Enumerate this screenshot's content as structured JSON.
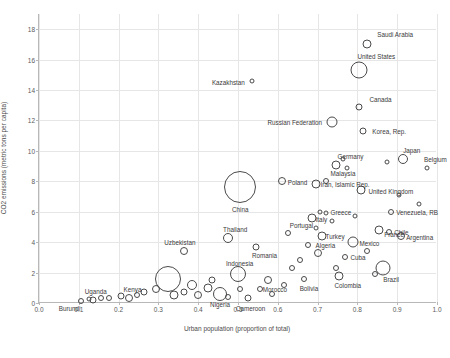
{
  "chart_data": {
    "type": "scatter",
    "title": "",
    "xlabel": "Urban population (proportion of total)",
    "ylabel": "CO2 emissions (metric tons per capita)",
    "xlim": [
      0.0,
      1.0
    ],
    "ylim": [
      0,
      19
    ],
    "xticks": [
      "0.0",
      "0.1",
      "0.2",
      "0.3",
      "0.4",
      "0.5",
      "0.6",
      "0.7",
      "0.8",
      "0.9",
      "1.0"
    ],
    "yticks": [
      "0",
      "2",
      "4",
      "6",
      "8",
      "10",
      "12",
      "14",
      "16",
      "18"
    ],
    "grid": true,
    "legend": "none",
    "bubble_meaning": "marker size proportional to population",
    "points": [
      {
        "label": "Saudi Arabia",
        "x": 0.825,
        "y": 17.0,
        "size": 9,
        "label_dx": 10,
        "label_dy": -10
      },
      {
        "label": "United States",
        "x": 0.805,
        "y": 15.3,
        "size": 17,
        "label_dx": -2,
        "label_dy": -14
      },
      {
        "label": "Kazakhstan",
        "x": 0.535,
        "y": 14.6,
        "size": 5,
        "label_dx": -40,
        "label_dy": 1
      },
      {
        "label": "Canada",
        "x": 0.805,
        "y": 12.9,
        "size": 7,
        "label_dx": 10,
        "label_dy": -8
      },
      {
        "label": "Russian Federation",
        "x": 0.735,
        "y": 11.9,
        "size": 11,
        "label_dx": -64,
        "label_dy": 0
      },
      {
        "label": "Korea, Rep.",
        "x": 0.815,
        "y": 11.3,
        "size": 7,
        "label_dx": 9,
        "label_dy": 0
      },
      {
        "label": "Japan",
        "x": 0.915,
        "y": 9.5,
        "size": 10,
        "label_dx": 0,
        "label_dy": -9
      },
      {
        "label": "Germany",
        "x": 0.745,
        "y": 9.1,
        "size": 9,
        "label_dx": 2,
        "label_dy": -9
      },
      {
        "label": "Belgium",
        "x": 0.975,
        "y": 8.9,
        "size": 5,
        "label_dx": -3,
        "label_dy": -9
      },
      {
        "label": "Poland",
        "x": 0.61,
        "y": 8.0,
        "size": 8,
        "label_dx": 6,
        "label_dy": 1
      },
      {
        "label": "Iran, Islamic Rep.",
        "x": 0.695,
        "y": 7.8,
        "size": 9,
        "label_dx": 5,
        "label_dy": 0
      },
      {
        "label": "Malaysia",
        "x": 0.72,
        "y": 8.0,
        "size": 6,
        "label_dx": 5,
        "label_dy": -8
      },
      {
        "label": "United Kingdom",
        "x": 0.81,
        "y": 7.4,
        "size": 9,
        "label_dx": 7,
        "label_dy": 1
      },
      {
        "label": "China",
        "x": 0.505,
        "y": 7.6,
        "size": 32,
        "label_dx": -8,
        "label_dy": 22
      },
      {
        "label": "Venezuela, RB",
        "x": 0.885,
        "y": 6.0,
        "size": 6,
        "label_dx": 5,
        "label_dy": 0
      },
      {
        "label": "Greece",
        "x": 0.72,
        "y": 5.9,
        "size": 5,
        "label_dx": 5,
        "label_dy": -1
      },
      {
        "label": "Italy",
        "x": 0.685,
        "y": 5.6,
        "size": 9,
        "label_dx": 4,
        "label_dy": 1
      },
      {
        "label": "Chile",
        "x": 0.88,
        "y": 4.7,
        "size": 6,
        "label_dx": 5,
        "label_dy": 0
      },
      {
        "label": "Argentina",
        "x": 0.91,
        "y": 4.4,
        "size": 8,
        "label_dx": 5,
        "label_dy": 1
      },
      {
        "label": "France",
        "x": 0.855,
        "y": 4.8,
        "size": 9,
        "label_dx": 5,
        "label_dy": 4
      },
      {
        "label": "Turkey",
        "x": 0.71,
        "y": 4.4,
        "size": 9,
        "label_dx": 4,
        "label_dy": 0
      },
      {
        "label": "Mexico",
        "x": 0.79,
        "y": 4.0,
        "size": 11,
        "label_dx": 6,
        "label_dy": 1
      },
      {
        "label": "Portugal",
        "x": 0.625,
        "y": 4.6,
        "size": 6,
        "label_dx": 2,
        "label_dy": -8
      },
      {
        "label": "Thailand",
        "x": 0.475,
        "y": 4.3,
        "size": 10,
        "label_dx": -5,
        "label_dy": -9
      },
      {
        "label": "Cuba",
        "x": 0.77,
        "y": 3.0,
        "size": 6,
        "label_dx": 5,
        "label_dy": 0
      },
      {
        "label": "Brazil",
        "x": 0.865,
        "y": 2.3,
        "size": 15,
        "label_dx": 0,
        "label_dy": 11
      },
      {
        "label": "Algeria",
        "x": 0.7,
        "y": 3.3,
        "size": 8,
        "label_dx": -2,
        "label_dy": -8
      },
      {
        "label": "Romania",
        "x": 0.545,
        "y": 3.7,
        "size": 7,
        "label_dx": -4,
        "label_dy": 8
      },
      {
        "label": "Colombia",
        "x": 0.755,
        "y": 1.8,
        "size": 9,
        "label_dx": -5,
        "label_dy": 9
      },
      {
        "label": "Bolivia",
        "x": 0.665,
        "y": 1.6,
        "size": 6,
        "label_dx": -4,
        "label_dy": 9
      },
      {
        "label": "Morocco",
        "x": 0.575,
        "y": 1.5,
        "size": 8,
        "label_dx": -5,
        "label_dy": 9
      },
      {
        "label": "Indonesia",
        "x": 0.5,
        "y": 1.9,
        "size": 16,
        "label_dx": -12,
        "label_dy": -11
      },
      {
        "label": "Cameroon",
        "x": 0.525,
        "y": 0.35,
        "size": 7,
        "label_dx": -12,
        "label_dy": 10
      },
      {
        "label": "Nigeria",
        "x": 0.455,
        "y": 0.6,
        "size": 14,
        "label_dx": -10,
        "label_dy": 10
      },
      {
        "label": "Uzbekistan",
        "x": 0.365,
        "y": 3.4,
        "size": 8,
        "label_dx": -20,
        "label_dy": -9
      },
      {
        "label": "Kenya",
        "x": 0.225,
        "y": 0.35,
        "size": 8,
        "label_dx": -5,
        "label_dy": -9
      },
      {
        "label": "Uganda",
        "x": 0.135,
        "y": 0.2,
        "size": 7,
        "label_dx": -8,
        "label_dy": -9
      },
      {
        "label": "Burundi",
        "x": 0.105,
        "y": 0.1,
        "size": 6,
        "label_dx": -22,
        "label_dy": 7
      },
      {
        "label": "",
        "x": 0.325,
        "y": 1.6,
        "size": 26,
        "label_dx": 0,
        "label_dy": 0
      },
      {
        "label": "",
        "x": 0.385,
        "y": 1.2,
        "size": 10,
        "label_dx": 0,
        "label_dy": 0
      },
      {
        "label": "",
        "x": 0.425,
        "y": 1.0,
        "size": 9,
        "label_dx": 0,
        "label_dy": 0
      },
      {
        "label": "",
        "x": 0.295,
        "y": 0.9,
        "size": 8,
        "label_dx": 0,
        "label_dy": 0
      },
      {
        "label": "",
        "x": 0.265,
        "y": 0.7,
        "size": 7,
        "label_dx": 0,
        "label_dy": 0
      },
      {
        "label": "",
        "x": 0.245,
        "y": 0.55,
        "size": 6,
        "label_dx": 0,
        "label_dy": 0
      },
      {
        "label": "",
        "x": 0.205,
        "y": 0.45,
        "size": 7,
        "label_dx": 0,
        "label_dy": 0
      },
      {
        "label": "",
        "x": 0.175,
        "y": 0.35,
        "size": 6,
        "label_dx": 0,
        "label_dy": 0
      },
      {
        "label": "",
        "x": 0.155,
        "y": 0.3,
        "size": 6,
        "label_dx": 0,
        "label_dy": 0
      },
      {
        "label": "",
        "x": 0.125,
        "y": 0.25,
        "size": 5,
        "label_dx": 0,
        "label_dy": 0
      },
      {
        "label": "",
        "x": 0.34,
        "y": 0.5,
        "size": 9,
        "label_dx": 0,
        "label_dy": 0
      },
      {
        "label": "",
        "x": 0.365,
        "y": 0.7,
        "size": 7,
        "label_dx": 0,
        "label_dy": 0
      },
      {
        "label": "",
        "x": 0.4,
        "y": 0.5,
        "size": 8,
        "label_dx": 0,
        "label_dy": 0
      },
      {
        "label": "",
        "x": 0.435,
        "y": 1.5,
        "size": 7,
        "label_dx": 0,
        "label_dy": 0
      },
      {
        "label": "",
        "x": 0.475,
        "y": 0.4,
        "size": 6,
        "label_dx": 0,
        "label_dy": 0
      },
      {
        "label": "",
        "x": 0.505,
        "y": 0.9,
        "size": 6,
        "label_dx": 0,
        "label_dy": 0
      },
      {
        "label": "",
        "x": 0.555,
        "y": 0.9,
        "size": 6,
        "label_dx": 0,
        "label_dy": 0
      },
      {
        "label": "",
        "x": 0.585,
        "y": 0.6,
        "size": 6,
        "label_dx": 0,
        "label_dy": 0
      },
      {
        "label": "",
        "x": 0.615,
        "y": 1.2,
        "size": 6,
        "label_dx": 0,
        "label_dy": 0
      },
      {
        "label": "",
        "x": 0.635,
        "y": 2.3,
        "size": 6,
        "label_dx": 0,
        "label_dy": 0
      },
      {
        "label": "",
        "x": 0.655,
        "y": 2.8,
        "size": 6,
        "label_dx": 0,
        "label_dy": 0
      },
      {
        "label": "",
        "x": 0.675,
        "y": 3.8,
        "size": 6,
        "label_dx": 0,
        "label_dy": 0
      },
      {
        "label": "",
        "x": 0.695,
        "y": 4.9,
        "size": 5,
        "label_dx": 0,
        "label_dy": 0
      },
      {
        "label": "",
        "x": 0.705,
        "y": 6.0,
        "size": 5,
        "label_dx": 0,
        "label_dy": 0
      },
      {
        "label": "",
        "x": 0.735,
        "y": 5.4,
        "size": 5,
        "label_dx": 0,
        "label_dy": 0
      },
      {
        "label": "",
        "x": 0.745,
        "y": 2.3,
        "size": 6,
        "label_dx": 0,
        "label_dy": 0
      },
      {
        "label": "",
        "x": 0.765,
        "y": 9.5,
        "size": 5,
        "label_dx": 0,
        "label_dy": 0
      },
      {
        "label": "",
        "x": 0.775,
        "y": 8.9,
        "size": 5,
        "label_dx": 0,
        "label_dy": 0
      },
      {
        "label": "",
        "x": 0.795,
        "y": 5.7,
        "size": 5,
        "label_dx": 0,
        "label_dy": 0
      },
      {
        "label": "",
        "x": 0.825,
        "y": 3.4,
        "size": 6,
        "label_dx": 0,
        "label_dy": 0
      },
      {
        "label": "",
        "x": 0.845,
        "y": 1.9,
        "size": 6,
        "label_dx": 0,
        "label_dy": 0
      },
      {
        "label": "",
        "x": 0.875,
        "y": 9.3,
        "size": 5,
        "label_dx": 0,
        "label_dy": 0
      },
      {
        "label": "",
        "x": 0.905,
        "y": 7.1,
        "size": 5,
        "label_dx": 0,
        "label_dy": 0
      },
      {
        "label": "",
        "x": 0.955,
        "y": 6.5,
        "size": 5,
        "label_dx": 0,
        "label_dy": 0
      }
    ]
  }
}
